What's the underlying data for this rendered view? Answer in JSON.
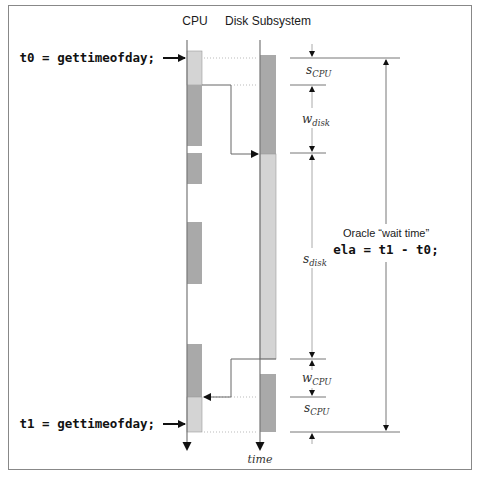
{
  "diagram": {
    "columns": {
      "cpu_label": "CPU",
      "disk_label": "Disk Subsystem"
    },
    "calls": {
      "start": "t0 = gettimeofday;",
      "end": "t1 = gettimeofday;"
    },
    "axis_label": "time",
    "wait_annotation": {
      "title": "Oracle “wait time”",
      "formula": "ela = t1 - t0;"
    },
    "intervals": [
      {
        "symbol": "s",
        "subscript": "CPU"
      },
      {
        "symbol": "w",
        "subscript": "disk"
      },
      {
        "symbol": "s",
        "subscript": "disk"
      },
      {
        "symbol": "w",
        "subscript": "CPU"
      },
      {
        "symbol": "s",
        "subscript": "CPU"
      }
    ],
    "colors": {
      "bar_light": "#d4d4d4",
      "bar_dark": "#a9a9a9",
      "line": "#666666",
      "frame": "#888888"
    }
  }
}
